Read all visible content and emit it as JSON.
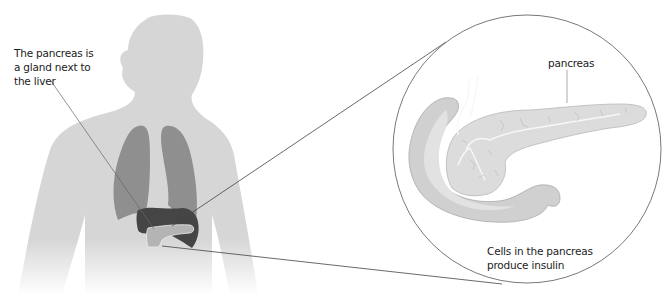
{
  "diagram": {
    "labels": {
      "gland_note_lines": [
        "The pancreas is",
        "a gland next to",
        "the liver"
      ],
      "pancreas": "pancreas",
      "cells_note_lines": [
        "Cells in the pancreas",
        "produce insulin"
      ]
    },
    "organs": [
      {
        "name": "lungs",
        "color": "#8f8f8f"
      },
      {
        "name": "liver",
        "color": "#454545"
      },
      {
        "name": "pancreas",
        "color": "#b4b4b4"
      }
    ],
    "colors": {
      "body": "#d6d6d6",
      "magnified_pancreas": "#dcdcdc",
      "duodenum": "#d0d0d0",
      "lines": "#555555"
    }
  }
}
